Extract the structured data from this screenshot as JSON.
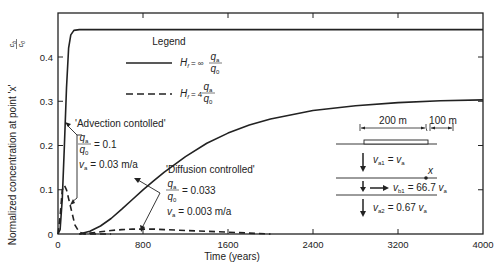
{
  "chart_data": {
    "type": "line",
    "title": "",
    "xlabel": "Time (years)",
    "ylabel": "Normalized concentration at point 'x'",
    "ylabel_fraction": {
      "numerator": "c_b",
      "denominator": "c_0"
    },
    "xlim": [
      0,
      4000
    ],
    "ylim": [
      0,
      0.47
    ],
    "x_ticks": [
      0,
      800,
      1600,
      2400,
      3200,
      4000
    ],
    "x_tick_labels": [
      "0",
      "800",
      "1600",
      "2400",
      "3200",
      "4000"
    ],
    "y_ticks": [
      0,
      0.1,
      0.2,
      0.3,
      0.4
    ],
    "y_tick_labels": [
      "0",
      "0.1",
      "0.2",
      "0.3",
      "0.4"
    ],
    "grid": false,
    "legend": {
      "title": "Legend",
      "placement": "top-center",
      "entries": [
        {
          "style": "solid",
          "label": "H_f = ∞ q_a/q_0"
        },
        {
          "style": "dashed",
          "label": "H_f = 4 q_a/q_0"
        }
      ]
    },
    "series": [
      {
        "name": "Advection controlled, H_f = ∞",
        "style": "solid",
        "x": [
          0,
          20,
          40,
          60,
          80,
          100,
          120,
          150,
          200,
          300,
          500,
          1000,
          2000,
          3000,
          4000
        ],
        "y": [
          0,
          0.01,
          0.08,
          0.2,
          0.33,
          0.42,
          0.45,
          0.46,
          0.462,
          0.462,
          0.462,
          0.462,
          0.462,
          0.462,
          0.462
        ]
      },
      {
        "name": "Advection controlled, H_f = 4",
        "style": "dashed",
        "x": [
          0,
          20,
          40,
          60,
          80,
          100,
          130,
          160,
          200,
          250,
          300,
          400,
          500
        ],
        "y": [
          0,
          0.04,
          0.1,
          0.11,
          0.1,
          0.08,
          0.05,
          0.02,
          0.004,
          0.0,
          0.0,
          0.0,
          0.0
        ]
      },
      {
        "name": "Diffusion controlled, H_f = ∞",
        "style": "solid",
        "x": [
          200,
          300,
          400,
          500,
          600,
          700,
          800,
          900,
          1000,
          1200,
          1400,
          1600,
          1800,
          2000,
          2400,
          2800,
          3200,
          3600,
          4000
        ],
        "y": [
          0,
          0.006,
          0.018,
          0.035,
          0.056,
          0.078,
          0.1,
          0.12,
          0.14,
          0.175,
          0.205,
          0.228,
          0.246,
          0.26,
          0.279,
          0.29,
          0.297,
          0.301,
          0.303
        ]
      },
      {
        "name": "Diffusion controlled, H_f = 4",
        "style": "dashed",
        "x": [
          200,
          300,
          400,
          500,
          600,
          700,
          800,
          900,
          1000,
          1200,
          1400,
          1600,
          1800,
          2000
        ],
        "y": [
          0,
          0.002,
          0.005,
          0.008,
          0.01,
          0.011,
          0.011,
          0.011,
          0.01,
          0.008,
          0.006,
          0.004,
          0.002,
          0.0
        ]
      }
    ],
    "annotations": [
      {
        "text": "'Advection contolled'",
        "params": [
          {
            "lhs": "q_a/q_0",
            "rhs": "0.1"
          },
          {
            "lhs": "v_a",
            "rhs": "0.03 m/a"
          }
        ]
      },
      {
        "text": "'Diffusion controlled'",
        "params": [
          {
            "lhs": "q_a/q_0",
            "rhs": "0.033"
          },
          {
            "lhs": "v_a",
            "rhs": "0.003 m/a"
          }
        ]
      }
    ],
    "inset_schematic": {
      "dim_left": "200 m",
      "dim_right": "100 m",
      "point_label": "x",
      "velocities": [
        {
          "sym": "v",
          "sub": "a1",
          "eq": "= ",
          "coef": "",
          "rhs_sym": "v",
          "rhs_sub": "a"
        },
        {
          "sym": "v",
          "sub": "b1",
          "eq": "= ",
          "coef": "66.7 ",
          "rhs_sym": "v",
          "rhs_sub": "a"
        },
        {
          "sym": "v",
          "sub": "a2",
          "eq": "= ",
          "coef": "0.67 ",
          "rhs_sym": "v",
          "rhs_sub": "a"
        }
      ]
    }
  },
  "text": {
    "legend_title": "Legend",
    "legend_h": "H",
    "legend_h_sub": "f",
    "legend_eq1": "= ∞",
    "legend_eq2": "= 4",
    "q": "q",
    "q_sub_a": "a",
    "q_sub_0": "0",
    "adv_title": "'Advection contolled'",
    "adv_q_val": "= 0.1",
    "adv_v_val": "= 0.03 m/a",
    "diff_title": "'Diffusion controlled'",
    "diff_q_val": "= 0.033",
    "diff_v_val": "= 0.003 m/a",
    "v": "v",
    "v_sub_a": "a",
    "ylabel": "Normalized concentration at point 'x'",
    "ylabel_c": "c",
    "ylabel_sub_b": "b",
    "ylabel_sub_0": "0",
    "xlabel": "Time (years)",
    "dim_left": "200 m",
    "dim_right": "100 m",
    "point_x": "x",
    "va1_sub": "a1",
    "va1_eq": "= ",
    "vb1_sub": "b1",
    "vb1_eq": "= 66.7 ",
    "va2_sub": "a2",
    "va2_eq": "= 0.67 "
  }
}
